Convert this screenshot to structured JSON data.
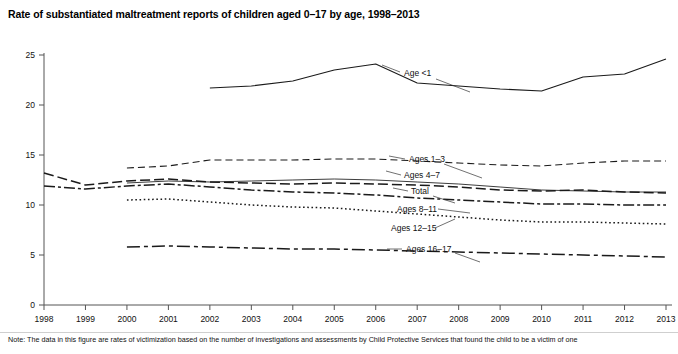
{
  "header": {
    "title": "Rate of substantiated maltreatment reports of children aged 0–17 by age, 1998–2013"
  },
  "note": {
    "label": "Note:",
    "text": "Note: The data in this figure are rates of victimization based on the number of investigations and assessments by Child Protective Services that found the child to be a victim of one"
  },
  "chart_data": {
    "type": "line",
    "title": "Rate of substantiated maltreatment reports of children aged 0–17 by age, 1998–2013",
    "xlabel": "",
    "ylabel": "",
    "xlim": [
      1998,
      2013
    ],
    "ylim": [
      0,
      25
    ],
    "grid": false,
    "legend": "inline-labels",
    "yticks": [
      "0",
      "5",
      "10",
      "15",
      "20",
      "25"
    ],
    "ytick_values": [
      0,
      5,
      10,
      15,
      20,
      25
    ],
    "x": [
      1998,
      1999,
      2000,
      2001,
      2002,
      2003,
      2004,
      2005,
      2006,
      2007,
      2008,
      2009,
      2010,
      2011,
      2012,
      2013
    ],
    "xticks": [
      "1998",
      "1999",
      "2000",
      "2001",
      "2002",
      "2003",
      "2004",
      "2005",
      "2006",
      "2007",
      "2008",
      "2009",
      "2010",
      "2011",
      "2012",
      "2013"
    ],
    "series": [
      {
        "name": "Age <1",
        "label": "Age <1",
        "style": "solid",
        "x": [
          2002,
          2003,
          2004,
          2005,
          2006,
          2007,
          2008,
          2009,
          2010,
          2011,
          2012,
          2013
        ],
        "values": [
          21.7,
          21.9,
          22.4,
          23.5,
          24.1,
          22.2,
          21.9,
          21.6,
          21.4,
          22.8,
          23.1,
          24.6
        ]
      },
      {
        "name": "Ages 1-3",
        "label": "Ages 1–3",
        "style": "dashed",
        "x": [
          2000,
          2001,
          2002,
          2003,
          2004,
          2005,
          2006,
          2007,
          2008,
          2009,
          2010,
          2011,
          2012,
          2013
        ],
        "values": [
          13.7,
          13.9,
          14.5,
          14.5,
          14.5,
          14.6,
          14.6,
          14.4,
          14.2,
          14.0,
          13.9,
          14.2,
          14.4,
          14.4
        ]
      },
      {
        "name": "Ages 4-7",
        "label": "Ages 4–7",
        "style": "long-dash",
        "x": [
          1998,
          1999,
          2000,
          2001,
          2002,
          2003,
          2004,
          2005,
          2006,
          2007,
          2008,
          2009,
          2010,
          2011,
          2012,
          2013
        ],
        "values": [
          13.2,
          12.0,
          12.4,
          12.6,
          12.3,
          12.2,
          12.1,
          12.2,
          12.1,
          12.0,
          11.8,
          11.5,
          11.4,
          11.5,
          11.3,
          11.2
        ]
      },
      {
        "name": "Total",
        "label": "Total",
        "style": "thin-solid",
        "x": [
          2000,
          2001,
          2002,
          2003,
          2004,
          2005,
          2006,
          2007,
          2008,
          2009,
          2010,
          2011,
          2012,
          2013
        ],
        "values": [
          12.2,
          12.4,
          12.3,
          12.4,
          12.5,
          12.6,
          12.5,
          12.3,
          12.1,
          11.8,
          11.5,
          11.4,
          11.3,
          11.3
        ]
      },
      {
        "name": "Ages 8-11",
        "label": "Ages 8–11",
        "style": "dash-dot",
        "x": [
          1998,
          1999,
          2000,
          2001,
          2002,
          2003,
          2004,
          2005,
          2006,
          2007,
          2008,
          2009,
          2010,
          2011,
          2012,
          2013
        ],
        "values": [
          11.9,
          11.6,
          11.9,
          12.1,
          11.8,
          11.5,
          11.3,
          11.2,
          11.0,
          10.7,
          10.5,
          10.3,
          10.1,
          10.1,
          10.0,
          10.0
        ]
      },
      {
        "name": "Ages 12-15",
        "label": "Ages 12–15",
        "style": "dotted",
        "x": [
          2000,
          2001,
          2002,
          2003,
          2004,
          2005,
          2006,
          2007,
          2008,
          2009,
          2010,
          2011,
          2012,
          2013
        ],
        "values": [
          10.5,
          10.6,
          10.3,
          10.0,
          9.8,
          9.7,
          9.4,
          9.1,
          8.8,
          8.5,
          8.3,
          8.3,
          8.2,
          8.1
        ]
      },
      {
        "name": "Ages 16-17",
        "label": "Ages 16–17",
        "style": "dash-dot-long",
        "x": [
          2000,
          2001,
          2002,
          2003,
          2004,
          2005,
          2006,
          2007,
          2008,
          2009,
          2010,
          2011,
          2012,
          2013
        ],
        "values": [
          5.8,
          5.9,
          5.8,
          5.7,
          5.6,
          5.6,
          5.5,
          5.4,
          5.3,
          5.2,
          5.1,
          5.0,
          4.9,
          4.8
        ]
      }
    ],
    "annotations": [
      {
        "name": "label-age-lt-1",
        "text": "Age <1"
      },
      {
        "name": "label-ages-1-3",
        "text": "Ages 1–3"
      },
      {
        "name": "label-ages-4-7",
        "text": "Ages 4–7"
      },
      {
        "name": "label-total",
        "text": "Total"
      },
      {
        "name": "label-ages-8-11",
        "text": "Ages 8–11"
      },
      {
        "name": "label-ages-12-15",
        "text": "Ages 12–15"
      },
      {
        "name": "label-ages-16-17",
        "text": "Ages 16–17"
      }
    ]
  },
  "colors": {
    "ink": "#1a1a1a",
    "axis": "#555555",
    "background": "#ffffff"
  }
}
